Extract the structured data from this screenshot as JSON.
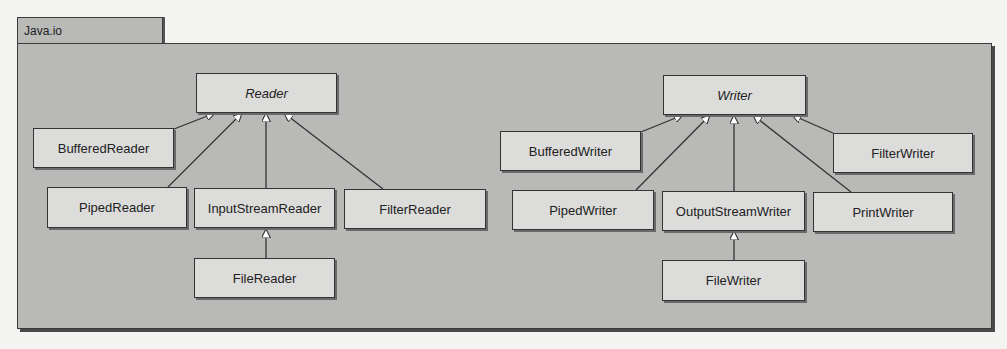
{
  "package": {
    "name": "Java.io"
  },
  "colors": {
    "package_fill": "#b9b9b7",
    "class_fill": "#dcdcda",
    "border": "#333333",
    "arrowhead_fill": "#ffffff"
  },
  "classes": {
    "reader": {
      "label": "Reader",
      "abstract": true
    },
    "buffered_reader": {
      "label": "BufferedReader"
    },
    "piped_reader": {
      "label": "PipedReader"
    },
    "input_stream_reader": {
      "label": "InputStreamReader"
    },
    "filter_reader": {
      "label": "FilterReader"
    },
    "file_reader": {
      "label": "FileReader"
    },
    "writer": {
      "label": "Writer",
      "abstract": true
    },
    "buffered_writer": {
      "label": "BufferedWriter"
    },
    "piped_writer": {
      "label": "PipedWriter"
    },
    "output_stream_writer": {
      "label": "OutputStreamWriter"
    },
    "print_writer": {
      "label": "PrintWriter"
    },
    "filter_writer": {
      "label": "FilterWriter"
    },
    "file_writer": {
      "label": "FileWriter"
    }
  },
  "relationships": [
    {
      "type": "generalization",
      "child": "BufferedReader",
      "parent": "Reader"
    },
    {
      "type": "generalization",
      "child": "PipedReader",
      "parent": "Reader"
    },
    {
      "type": "generalization",
      "child": "InputStreamReader",
      "parent": "Reader"
    },
    {
      "type": "generalization",
      "child": "FilterReader",
      "parent": "Reader"
    },
    {
      "type": "generalization",
      "child": "FileReader",
      "parent": "InputStreamReader"
    },
    {
      "type": "generalization",
      "child": "BufferedWriter",
      "parent": "Writer"
    },
    {
      "type": "generalization",
      "child": "PipedWriter",
      "parent": "Writer"
    },
    {
      "type": "generalization",
      "child": "OutputStreamWriter",
      "parent": "Writer"
    },
    {
      "type": "generalization",
      "child": "PrintWriter",
      "parent": "Writer"
    },
    {
      "type": "generalization",
      "child": "FilterWriter",
      "parent": "Writer"
    },
    {
      "type": "generalization",
      "child": "FileWriter",
      "parent": "OutputStreamWriter"
    }
  ]
}
